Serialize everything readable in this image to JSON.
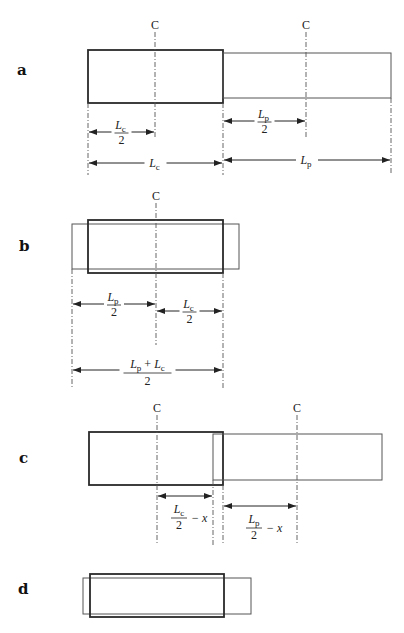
{
  "figure": {
    "width": 404,
    "height": 633,
    "colors": {
      "thick_stroke": "#2a2a2a",
      "thin_stroke": "#555555",
      "text": "#222222",
      "background": "#ffffff"
    },
    "center_marker": "C",
    "panels": [
      {
        "id": "a",
        "label": "a",
        "label_pos": [
          17,
          75
        ],
        "rects": [
          {
            "role": "core",
            "style": "thick",
            "x": 88,
            "y": 50,
            "w": 135,
            "h": 53
          },
          {
            "role": "plunger",
            "style": "thin",
            "x": 223,
            "y": 53,
            "w": 168,
            "h": 45
          }
        ],
        "centers": [
          {
            "x": 155,
            "label_y": 29,
            "line_top": 32,
            "line_bottom": 137
          },
          {
            "x": 306,
            "label_y": 29,
            "line_top": 32,
            "line_bottom": 137
          }
        ],
        "extension_lines": [
          {
            "x": 88,
            "top": 103,
            "bottom": 175
          },
          {
            "x": 223,
            "top": 103,
            "bottom": 175
          },
          {
            "x": 391,
            "top": 98,
            "bottom": 175
          }
        ],
        "dimensions": [
          {
            "x1": 88,
            "x2": 155,
            "y": 132,
            "num": "L",
            "sub": "c",
            "den": "2",
            "suffix": "",
            "type": "fraction"
          },
          {
            "x1": 223,
            "x2": 306,
            "y": 121,
            "num": "L",
            "sub": "p",
            "den": "2",
            "suffix": "",
            "type": "fraction"
          },
          {
            "x1": 88,
            "x2": 223,
            "y": 163,
            "num": "L",
            "sub": "c",
            "den": "",
            "suffix": "",
            "type": "simple"
          },
          {
            "x1": 223,
            "x2": 391,
            "y": 160,
            "num": "L",
            "sub": "p",
            "den": "",
            "suffix": "",
            "type": "simple"
          }
        ]
      },
      {
        "id": "b",
        "label": "b",
        "label_pos": [
          19,
          251
        ],
        "rects": [
          {
            "role": "plunger",
            "style": "thin",
            "x": 72,
            "y": 224,
            "w": 167,
            "h": 45
          },
          {
            "role": "core",
            "style": "thick",
            "x": 88,
            "y": 220,
            "w": 135,
            "h": 53
          }
        ],
        "centers": [
          {
            "x": 156,
            "label_y": 200,
            "line_top": 203,
            "line_bottom": 345
          }
        ],
        "extension_lines": [
          {
            "x": 72,
            "top": 269,
            "bottom": 388
          },
          {
            "x": 223,
            "top": 273,
            "bottom": 388
          }
        ],
        "dimensions": [
          {
            "x1": 72,
            "x2": 156,
            "y": 304,
            "num": "L",
            "sub": "p",
            "den": "2",
            "suffix": "",
            "type": "fraction"
          },
          {
            "x1": 156,
            "x2": 223,
            "y": 311,
            "num": "L",
            "sub": "c",
            "den": "2",
            "suffix": "",
            "type": "fraction"
          },
          {
            "x1": 72,
            "x2": 223,
            "y": 370,
            "num": "L_p + L_c",
            "sub": "",
            "den": "2",
            "suffix": "",
            "type": "sum-fraction"
          }
        ]
      },
      {
        "id": "c",
        "label": "c",
        "label_pos": [
          19,
          463
        ],
        "rects": [
          {
            "role": "core",
            "style": "thick",
            "x": 89,
            "y": 432,
            "w": 134,
            "h": 53
          },
          {
            "role": "plunger",
            "style": "thin",
            "x": 213,
            "y": 434,
            "w": 169,
            "h": 46
          }
        ],
        "centers": [
          {
            "x": 157,
            "label_y": 412,
            "line_top": 415,
            "line_bottom": 545
          },
          {
            "x": 297,
            "label_y": 412,
            "line_top": 415,
            "line_bottom": 545
          }
        ],
        "extension_lines": [
          {
            "x": 213,
            "top": 480,
            "bottom": 545
          },
          {
            "x": 223,
            "top": 485,
            "bottom": 545
          }
        ],
        "dimensions": [
          {
            "x1": 157,
            "x2": 213,
            "y": 496,
            "num": "L",
            "sub": "c",
            "den": "2",
            "suffix": "− x",
            "type": "fraction-minus"
          },
          {
            "x1": 223,
            "x2": 297,
            "y": 506,
            "num": "L",
            "sub": "p",
            "den": "2",
            "suffix": "− x",
            "type": "fraction-minus"
          }
        ]
      },
      {
        "id": "d",
        "label": "d",
        "label_pos": [
          18,
          594
        ],
        "rects": [
          {
            "role": "plunger",
            "style": "thin",
            "x": 83,
            "y": 578,
            "w": 168,
            "h": 36
          },
          {
            "role": "core",
            "style": "thick",
            "x": 90,
            "y": 574,
            "w": 134,
            "h": 43
          }
        ],
        "centers": [],
        "extension_lines": [],
        "dimensions": []
      }
    ]
  }
}
